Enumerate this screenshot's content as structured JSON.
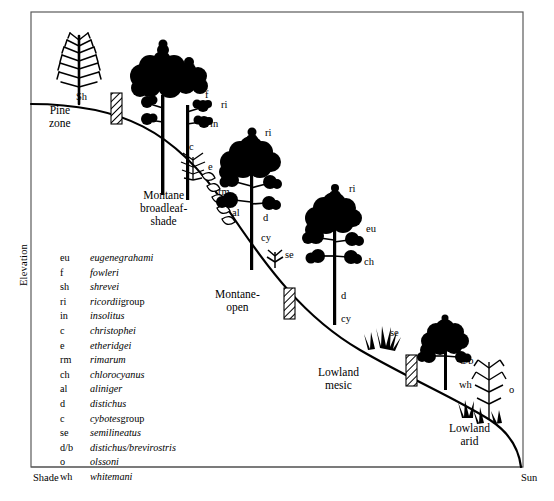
{
  "figure": {
    "axes": {
      "y_label": "Elevation",
      "x_left_label": "Shade",
      "x_right_label": "Sun"
    },
    "zones": [
      {
        "id": "pine",
        "label": "Pine\nzone"
      },
      {
        "id": "montane-broadleaf-shade",
        "label": "Montane\nbroadleaf-\nshade"
      },
      {
        "id": "montane-open",
        "label": "Montane-\nopen"
      },
      {
        "id": "lowland-mesic",
        "label": "Lowland\nmesic"
      },
      {
        "id": "lowland-arid",
        "label": "Lowland\narid"
      }
    ],
    "species_markers": [
      {
        "code": "Sh",
        "x": 76,
        "y": 91
      },
      {
        "code": "f",
        "x": 205,
        "y": 89
      },
      {
        "code": "ri",
        "x": 221,
        "y": 99
      },
      {
        "code": "in",
        "x": 210,
        "y": 118
      },
      {
        "code": "c",
        "x": 189,
        "y": 141
      },
      {
        "code": "e",
        "x": 208,
        "y": 161
      },
      {
        "code": "rm",
        "x": 218,
        "y": 186
      },
      {
        "code": "ri",
        "x": 265,
        "y": 127
      },
      {
        "code": "al",
        "x": 232,
        "y": 207
      },
      {
        "code": "d",
        "x": 263,
        "y": 212
      },
      {
        "code": "cy",
        "x": 261,
        "y": 232
      },
      {
        "code": "se",
        "x": 285,
        "y": 249
      },
      {
        "code": "ri",
        "x": 349,
        "y": 183
      },
      {
        "code": "eu",
        "x": 366,
        "y": 223
      },
      {
        "code": "ch",
        "x": 364,
        "y": 256
      },
      {
        "code": "d",
        "x": 341,
        "y": 290
      },
      {
        "code": "cy",
        "x": 341,
        "y": 313
      },
      {
        "code": "se",
        "x": 390,
        "y": 327
      },
      {
        "code": "d/b",
        "x": 460,
        "y": 355
      },
      {
        "code": "wh",
        "x": 459,
        "y": 379
      },
      {
        "code": "o",
        "x": 509,
        "y": 384
      }
    ],
    "legend": [
      {
        "abbr": "eu",
        "name": "eugenegrahami",
        "suffix": ""
      },
      {
        "abbr": "f",
        "name": "fowleri",
        "suffix": ""
      },
      {
        "abbr": "sh",
        "name": "shrevei",
        "suffix": ""
      },
      {
        "abbr": "ri",
        "name": "ricordii",
        "suffix": " group"
      },
      {
        "abbr": "in",
        "name": "insolitus",
        "suffix": ""
      },
      {
        "abbr": "c",
        "name": "christophei",
        "suffix": ""
      },
      {
        "abbr": "e",
        "name": "etheridgei",
        "suffix": ""
      },
      {
        "abbr": "rm",
        "name": "rimarum",
        "suffix": ""
      },
      {
        "abbr": "ch",
        "name": "chlorocyanus",
        "suffix": ""
      },
      {
        "abbr": "al",
        "name": "aliniger",
        "suffix": ""
      },
      {
        "abbr": "d",
        "name": "distichus",
        "suffix": ""
      },
      {
        "abbr": "c",
        "name": "cybotes",
        "suffix": " group"
      },
      {
        "abbr": "se",
        "name": "semilineatus",
        "suffix": ""
      },
      {
        "abbr": "d/b",
        "name": "distichus/brevirostris",
        "suffix": ""
      },
      {
        "abbr": "o",
        "name": "olssoni",
        "suffix": ""
      },
      {
        "abbr": "wh",
        "name": "whitemani",
        "suffix": ""
      }
    ],
    "colors": {
      "ink": "#000000",
      "background": "#ffffff",
      "frame": "#3a3a3a"
    }
  }
}
